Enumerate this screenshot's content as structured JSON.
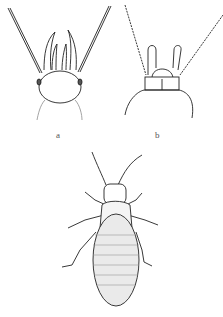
{
  "figure": {
    "panels": [
      {
        "id": "a",
        "label": "a",
        "description": "head with antennae and mouthparts, dorsal view"
      },
      {
        "id": "b",
        "label": "b",
        "description": "head with spiny antennae and palps, dorsal view"
      },
      {
        "id": "c",
        "label": "",
        "description": "whole insect, dorsal view"
      }
    ]
  }
}
